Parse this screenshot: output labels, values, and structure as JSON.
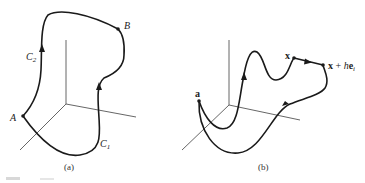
{
  "panels": [
    {
      "id": "a",
      "caption": "(a)",
      "points": [
        {
          "name": "A",
          "label": "A"
        },
        {
          "name": "B",
          "label": "B"
        }
      ],
      "curves": [
        {
          "name": "C1",
          "label_main": "C",
          "label_sub": "1"
        },
        {
          "name": "C2",
          "label_main": "C",
          "label_sub": "2"
        }
      ]
    },
    {
      "id": "b",
      "caption": "(b)",
      "points": [
        {
          "name": "a",
          "label": "a"
        },
        {
          "name": "x",
          "label": "x"
        },
        {
          "name": "x+he_i",
          "label_bold_x": "x",
          "label_plus": " + ",
          "label_h": "h",
          "label_bold_e": "e",
          "label_sub": "i"
        }
      ]
    }
  ],
  "colors": {
    "stroke": "#1a1a1a",
    "axis": "#555555",
    "background": "#ffffff"
  }
}
